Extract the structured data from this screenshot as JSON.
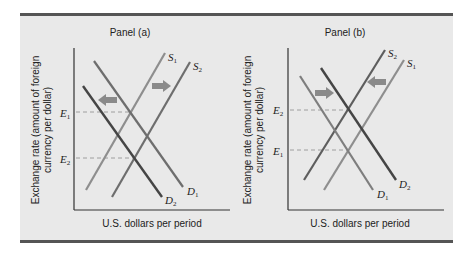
{
  "figure": {
    "panels": [
      {
        "id": "a",
        "title": "Panel (a)",
        "ylabel_line1": "Exchange rate (amount of foreign",
        "ylabel_line2": "currency per dollar)",
        "xlabel": "U.S. dollars per period",
        "equilibria": [
          {
            "label": "E",
            "sub": "1",
            "y_px": 112
          },
          {
            "label": "E",
            "sub": "2",
            "y_px": 158
          }
        ],
        "curves": [
          {
            "name": "D1",
            "label": "D",
            "sub": "1",
            "type": "demand",
            "color": "#6e6e6e"
          },
          {
            "name": "D2",
            "label": "D",
            "sub": "2",
            "type": "demand",
            "color": "#4a4a4a"
          },
          {
            "name": "S1",
            "label": "S",
            "sub": "1",
            "type": "supply",
            "color": "#8e8e8e"
          },
          {
            "name": "S2",
            "label": "S",
            "sub": "2",
            "type": "supply",
            "color": "#6e6e6e"
          }
        ],
        "shifts": [
          {
            "curve": "demand",
            "from": "D1",
            "to": "D2",
            "direction": "left"
          },
          {
            "curve": "supply",
            "from": "S1",
            "to": "S2",
            "direction": "right"
          }
        ],
        "outcome": "Exchange rate falls from E1 to E2"
      },
      {
        "id": "b",
        "title": "Panel (b)",
        "ylabel_line1": "Exchange rate (amount of foreign",
        "ylabel_line2": "currency per dollar)",
        "xlabel": "U.S. dollars per period",
        "equilibria": [
          {
            "label": "E",
            "sub": "2",
            "y_px": 110
          },
          {
            "label": "E",
            "sub": "1",
            "y_px": 150
          }
        ],
        "curves": [
          {
            "name": "D1",
            "label": "D",
            "sub": "1",
            "type": "demand",
            "color": "#7e7e7e"
          },
          {
            "name": "D2",
            "label": "D",
            "sub": "2",
            "type": "demand",
            "color": "#4a4a4a"
          },
          {
            "name": "S1",
            "label": "S",
            "sub": "1",
            "type": "supply",
            "color": "#8e8e8e"
          },
          {
            "name": "S2",
            "label": "S",
            "sub": "2",
            "type": "supply",
            "color": "#5e5e5e"
          }
        ],
        "shifts": [
          {
            "curve": "demand",
            "from": "D1",
            "to": "D2",
            "direction": "right"
          },
          {
            "curve": "supply",
            "from": "S1",
            "to": "S2",
            "direction": "left"
          }
        ],
        "outcome": "Exchange rate rises from E1 to E2"
      }
    ]
  },
  "colors": {
    "background": "#e9e9e9",
    "rule": "#555555",
    "axis": "#333333",
    "dashed": "#8a8a8a",
    "arrow": "#8a8a8a"
  }
}
